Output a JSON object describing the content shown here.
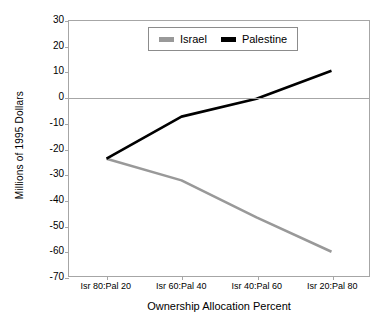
{
  "chart_data": {
    "type": "line",
    "title": "",
    "xlabel": "Ownership Allocation Percent",
    "ylabel": "Millions of 1995 Dollars",
    "categories": [
      "Isr 80:Pal 20",
      "Isr 60:Pal 40",
      "Isr 40:Pal 60",
      "Isr 20:Pal 80"
    ],
    "series": [
      {
        "name": "Israel",
        "color": "#999999",
        "values": [
          -24,
          -32.5,
          -47,
          -60.5
        ]
      },
      {
        "name": "Palestine",
        "color": "#000000",
        "values": [
          -24,
          -7.5,
          -0.5,
          10.5
        ]
      }
    ],
    "ylim": [
      -70,
      30
    ],
    "ytick_step": 10,
    "yticks": [
      30,
      20,
      10,
      0,
      -10,
      -20,
      -30,
      -40,
      -50,
      -60,
      -70
    ],
    "ytick_labels": [
      "30",
      "20",
      "10",
      "0",
      "-10",
      "-20",
      "-30",
      "-40",
      "-50",
      "-60",
      "-70"
    ],
    "grid": false,
    "zero_line": true,
    "legend_position": "top-center",
    "legend_entries": [
      "Israel",
      "Palestine"
    ]
  },
  "axes": {
    "y_axis_title": "Millions of 1995 Dollars",
    "x_axis_title": "Ownership Allocation Percent"
  },
  "legend": {
    "israel_label": "Israel",
    "palestine_label": "Palestine"
  },
  "colors": {
    "israel": "#999999",
    "palestine": "#000000",
    "axis": "#a6a6a6",
    "background": "#ffffff"
  }
}
